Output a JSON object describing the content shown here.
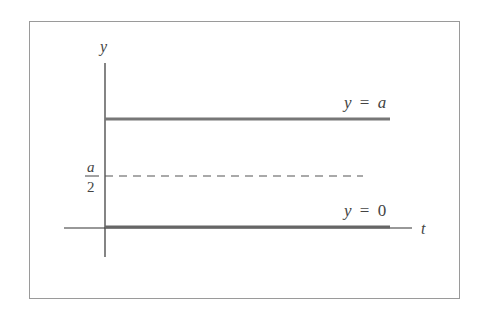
{
  "diagram": {
    "axes": {
      "vertical_label": "y",
      "horizontal_label": "t"
    },
    "lines": [
      {
        "id": "upper",
        "label_lhs": "y",
        "label_eq": "=",
        "label_rhs": "a",
        "style": "solid"
      },
      {
        "id": "middle",
        "tick_numerator": "a",
        "tick_denominator": "2",
        "style": "dashed"
      },
      {
        "id": "lower",
        "label_lhs": "y",
        "label_eq": "=",
        "label_rhs": "0",
        "style": "solid"
      }
    ],
    "colors": {
      "border": "#9a9a9a",
      "axis": "#333333",
      "solution_line": "#777777",
      "dashed_line": "#555555",
      "text": "#444444"
    }
  }
}
